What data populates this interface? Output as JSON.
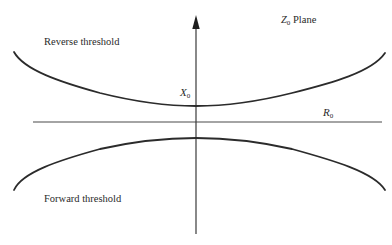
{
  "diagram": {
    "title": "Z0 Plane",
    "plane_label": {
      "symbol": "Z",
      "subscript": "0",
      "text": "Plane"
    },
    "axes": {
      "vertical": {
        "label_symbol": "X",
        "label_subscript": "0",
        "has_arrow": true
      },
      "horizontal": {
        "label_symbol": "R",
        "label_subscript": "0",
        "has_arrow": false
      }
    },
    "curves": [
      {
        "name": "reverse-threshold",
        "label": "Reverse threshold",
        "shape": "upward-opening hyperbola branch above R0 axis"
      },
      {
        "name": "forward-threshold",
        "label": "Forward threshold",
        "shape": "downward-opening hyperbola branch below R0 axis"
      }
    ],
    "colors": {
      "line": "#2b2b2b",
      "text": "#2a2a2a",
      "background": "#ffffff"
    }
  }
}
